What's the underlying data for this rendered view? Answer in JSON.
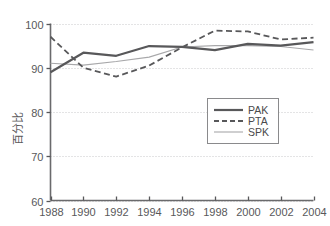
{
  "chart_data": {
    "type": "line",
    "title": "",
    "xlabel": "",
    "ylabel": "百分比",
    "x": [
      1988,
      1990,
      1992,
      1994,
      1996,
      1998,
      2000,
      2002,
      2004
    ],
    "xlim": [
      1988,
      2004
    ],
    "ylim": [
      60,
      100
    ],
    "xticks": [
      "1988",
      "1990",
      "1992",
      "1994",
      "1996",
      "1998",
      "2000",
      "2002",
      "2004"
    ],
    "yticks": [
      "60",
      "70",
      "80",
      "90",
      "100"
    ],
    "grid": true,
    "grid_axis": "y",
    "legend_position": "center-right",
    "series": [
      {
        "name": "PAK",
        "style": "solid-thick",
        "color": "#58585a",
        "values": [
          89.0,
          93.4,
          92.7,
          94.9,
          94.7,
          94.0,
          95.4,
          95.0,
          95.8
        ]
      },
      {
        "name": "PTA",
        "style": "dashed",
        "color": "#58585a",
        "values": [
          97.0,
          90.0,
          88.0,
          90.5,
          94.6,
          98.4,
          98.2,
          96.4,
          96.8
        ]
      },
      {
        "name": "SPK",
        "style": "solid-thin",
        "color": "#a8a8aa",
        "values": [
          91.0,
          90.6,
          91.4,
          92.4,
          94.7,
          95.0,
          95.0,
          94.8,
          94.0
        ]
      }
    ]
  },
  "legend": {
    "entries": [
      {
        "label": "PAK",
        "swatch": "solid-thick-swatch"
      },
      {
        "label": "PTA",
        "swatch": "dashed-swatch"
      },
      {
        "label": "SPK",
        "swatch": "solid-thin-swatch"
      }
    ]
  },
  "axes": {
    "y_title": "百分比",
    "y_tick_labels": [
      "100",
      "90",
      "80",
      "70",
      "60"
    ],
    "x_tick_labels": [
      "1988",
      "1990",
      "1992",
      "1994",
      "1996",
      "1998",
      "2000",
      "2002",
      "2004"
    ]
  },
  "colors": {
    "axis": "#58585a",
    "grid": "#c9c9cb",
    "series_dark": "#58585a",
    "series_light": "#a8a8aa",
    "background": "#ffffff"
  }
}
